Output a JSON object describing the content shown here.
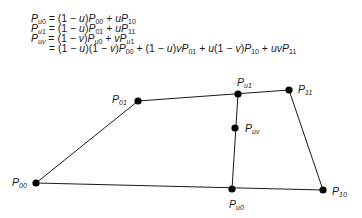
{
  "equations": [
    {
      "lhs": "P_u0",
      "rhs": "= (1 − u)P_00 + uP_10"
    },
    {
      "lhs": "P_u1",
      "rhs": "= (1 − u)P_01 + uP_11"
    },
    {
      "lhs": "P_uv",
      "rhs": "= (1 − v)P_u0 + vP_u1"
    },
    {
      "lhs": "",
      "rhs": "= (1 − u)(1 − v)P_00 + (1 − u)vP_01 + u(1 − v)P_10 + uvP_11"
    }
  ],
  "points": [
    {
      "id": "P00",
      "label": "P",
      "sub": "00",
      "x": 36,
      "y": 183
    },
    {
      "id": "P01",
      "label": "P",
      "sub": "01",
      "x": 138,
      "y": 101
    },
    {
      "id": "Pu1",
      "label": "P",
      "sub": "u1",
      "x": 238,
      "y": 94
    },
    {
      "id": "P11",
      "label": "P",
      "sub": "11",
      "x": 289,
      "y": 90
    },
    {
      "id": "Puv",
      "label": "P",
      "sub": "uv",
      "x": 235,
      "y": 128
    },
    {
      "id": "Pu0",
      "label": "P",
      "sub": "u0",
      "x": 232,
      "y": 189
    },
    {
      "id": "P10",
      "label": "P",
      "sub": "10",
      "x": 323,
      "y": 190
    }
  ],
  "edges": [
    [
      "P00",
      "P01"
    ],
    [
      "P01",
      "P11"
    ],
    [
      "P11",
      "P10"
    ],
    [
      "P00",
      "P10"
    ],
    [
      "Pu0",
      "Pu1"
    ]
  ]
}
